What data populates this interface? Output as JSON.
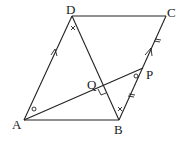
{
  "diagram": {
    "type": "geometry-parallelogram",
    "points": {
      "A": {
        "label": "A",
        "x": 24,
        "y": 120
      },
      "B": {
        "label": "B",
        "x": 119,
        "y": 120
      },
      "C": {
        "label": "C",
        "x": 166,
        "y": 16
      },
      "D": {
        "label": "D",
        "x": 72,
        "y": 16
      },
      "P": {
        "label": "P",
        "x": 143,
        "y": 68
      },
      "Q": {
        "label": "Q",
        "x": 101,
        "y": 87
      }
    },
    "segments": [
      "AB",
      "BC",
      "CD",
      "DA",
      "DB",
      "AP"
    ],
    "markings": {
      "parallel_arrows": [
        "AD",
        "BC"
      ],
      "equal_ticks": [
        "BP",
        "PC"
      ],
      "right_angle": "Q",
      "equal_angles_circle": [
        "DAP",
        "APB"
      ],
      "equal_angles_cross": [
        "ADB",
        "DBP"
      ]
    }
  }
}
